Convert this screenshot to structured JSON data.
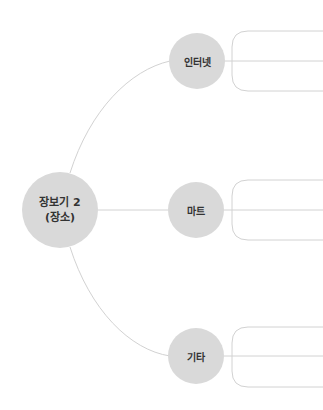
{
  "root": {
    "line1": "장보기 2",
    "line2": "(장소)"
  },
  "branches": [
    {
      "label": "인터넷"
    },
    {
      "label": "마트"
    },
    {
      "label": "기타"
    }
  ],
  "colors": {
    "node_fill": "#d9d9d9",
    "line": "#d0d0d0",
    "text": "#333333"
  }
}
